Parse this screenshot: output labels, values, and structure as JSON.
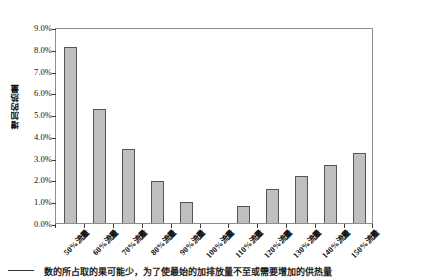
{
  "chart_data": {
    "type": "bar",
    "title": "",
    "xlabel": "",
    "ylabel": "增加的热量",
    "categories": [
      "50%流量",
      "60%流量",
      "70%流量",
      "80%流量",
      "90%流量",
      "100%流量",
      "110%流量",
      "120%流量",
      "130%流量",
      "140%流量",
      "150%流量"
    ],
    "values": [
      8.1,
      5.25,
      3.4,
      1.95,
      0.95,
      0.0,
      0.8,
      1.55,
      2.15,
      2.65,
      3.2
    ],
    "value_unit": "%",
    "ylim": [
      0,
      9
    ],
    "ytick_values": [
      0,
      1,
      2,
      3,
      4,
      5,
      6,
      7,
      8,
      9
    ],
    "ytick_labels": [
      "0.0%",
      "1.0%",
      "2.0%",
      "3.0%",
      "4.0%",
      "5.0%",
      "6.0%",
      "7.0%",
      "8.0%",
      "9.0%"
    ],
    "grid": false,
    "legend": null,
    "bar_fill_color": "#bfbfbf",
    "bar_border_color": "#555555",
    "frame_color": "#8e8e8e",
    "background_color": "#ffffff"
  },
  "caption": {
    "text": "数的所占取的果可能少，为了使最始的加排放量不至或需要增加的供热量",
    "leader": ""
  }
}
